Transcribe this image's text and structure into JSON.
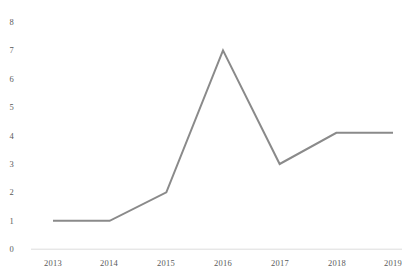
{
  "chart_data": {
    "type": "line",
    "title": "",
    "subtitle": "",
    "xlabel": "",
    "ylabel": "",
    "categories": [
      "2013",
      "2014",
      "2015",
      "2016",
      "2017",
      "2018",
      "2019"
    ],
    "series": [
      {
        "name": "",
        "values": [
          1,
          1,
          2,
          7,
          3,
          4.1,
          4.1
        ],
        "color": "#8a8a8a"
      }
    ],
    "ylim": [
      0,
      8
    ],
    "y_ticks": [
      "0",
      "1",
      "2",
      "3",
      "4",
      "5",
      "6",
      "7",
      "8"
    ],
    "y_tick_values": [
      0,
      1,
      2,
      3,
      4,
      5,
      6,
      7,
      8
    ],
    "x_ticks": [
      "2013",
      "2014",
      "2015",
      "2016",
      "2017",
      "2018",
      "2019"
    ],
    "grid": false,
    "legend": false,
    "legend_position": "none",
    "annotations": [],
    "axis_line_color": "#d9d9d9",
    "tick_label_color": "#5a5a5a",
    "background_color": "#ffffff"
  }
}
